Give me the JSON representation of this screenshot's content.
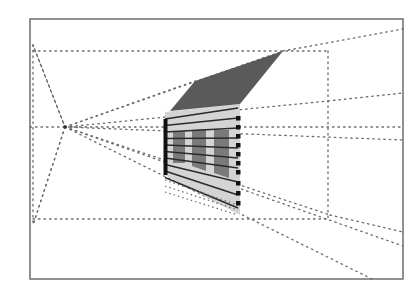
{
  "diagram": {
    "type": "one-point perspective construction drawing",
    "frame": {
      "x1": 30,
      "y1": 19,
      "x2": 403,
      "y2": 279
    },
    "vanishing_point": {
      "x": 65,
      "y": 127
    },
    "colors": {
      "background": "#ffffff",
      "frame": "#6e6e6e",
      "roof": "#5a5a5a",
      "wall": "#d4d4d4",
      "window": "#7a7a7a",
      "wall_line": "#2a2a2a",
      "marker": "#111111",
      "construction_line": "#6a6a6a"
    },
    "guide_box": {
      "top_y": 51,
      "bottom_y": 219,
      "left_x": 33,
      "right_x": 328
    },
    "roof": [
      [
        170,
        111
      ],
      [
        195,
        81
      ],
      [
        283,
        51
      ],
      [
        240,
        104
      ]
    ],
    "wall": [
      [
        165,
        112
      ],
      [
        240,
        104
      ],
      [
        240,
        215
      ],
      [
        165,
        175
      ]
    ],
    "windows": [
      {
        "quad": [
          [
            173,
            132
          ],
          [
            185,
            131
          ],
          [
            185,
            163
          ],
          [
            173,
            163
          ]
        ]
      },
      {
        "quad": [
          [
            192,
            130
          ],
          [
            206,
            129
          ],
          [
            206,
            171
          ],
          [
            192,
            166
          ]
        ]
      },
      {
        "quad": [
          [
            214,
            130
          ],
          [
            229,
            130
          ],
          [
            229,
            178
          ],
          [
            214,
            173
          ]
        ]
      }
    ],
    "front_edge_x": 165,
    "back_edge_x": 238,
    "construction_lines": [
      [
        33,
        51,
        328,
        51
      ],
      [
        33,
        219,
        328,
        219
      ],
      [
        328,
        51,
        328,
        219
      ],
      [
        33,
        45,
        33,
        225
      ],
      [
        30,
        127,
        403,
        127
      ],
      [
        65,
        127,
        33,
        45
      ],
      [
        65,
        127,
        33,
        225
      ],
      [
        65,
        127,
        195,
        81
      ],
      [
        65,
        127,
        283,
        51
      ],
      [
        283,
        51,
        403,
        29
      ],
      [
        65,
        127,
        328,
        101
      ],
      [
        328,
        101,
        403,
        93
      ],
      [
        65,
        127,
        403,
        140
      ],
      [
        65,
        127,
        330,
        215
      ],
      [
        330,
        215,
        403,
        232
      ],
      [
        65,
        127,
        403,
        246
      ],
      [
        65,
        127,
        372,
        279
      ],
      [
        33,
        45,
        65,
        127
      ],
      [
        65,
        127,
        33,
        225
      ]
    ]
  }
}
